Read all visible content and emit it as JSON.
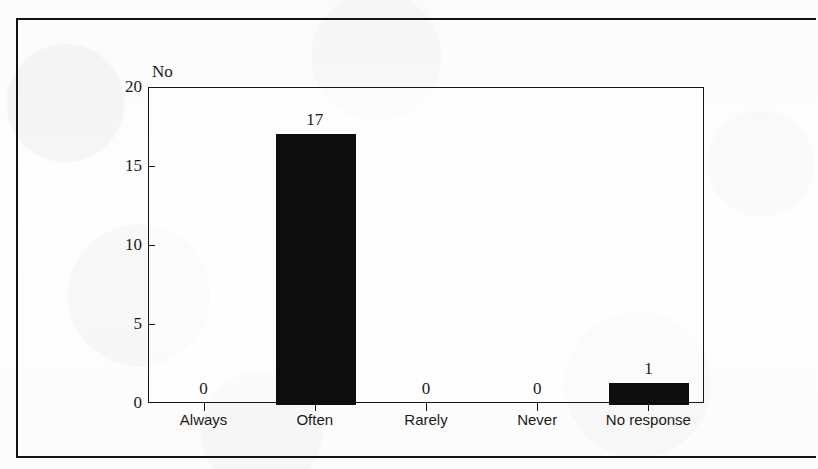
{
  "figure": {
    "title_remnant": "",
    "y_unit_label": "No"
  },
  "chart_data": {
    "type": "bar",
    "title": "",
    "xlabel": "",
    "ylabel": "No",
    "categories": [
      "Always",
      "Often",
      "Rarely",
      "Never",
      "No response"
    ],
    "values": [
      0,
      17,
      0,
      0,
      1
    ],
    "value_labels": [
      "0",
      "17",
      "0",
      "0",
      "1"
    ],
    "ylim": [
      0,
      20
    ],
    "yticks": [
      0,
      5,
      10,
      15,
      20
    ],
    "ytick_labels": [
      "0",
      "5",
      "10",
      "15",
      "20"
    ],
    "grid": false,
    "legend": null,
    "bar_color": "#0d0d0d",
    "axis_color": "#161616",
    "background": "#fdfdfd"
  }
}
